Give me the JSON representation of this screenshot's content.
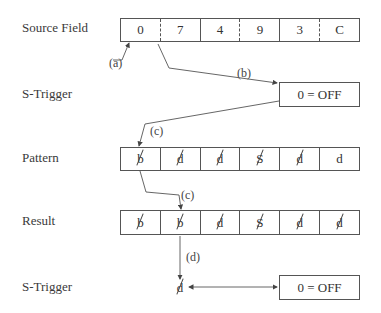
{
  "labels": {
    "source_field": "Source Field",
    "s_trigger_1": "S-Trigger",
    "pattern": "Pattern",
    "result": "Result",
    "s_trigger_2": "S-Trigger"
  },
  "source_field": {
    "cells": [
      {
        "value": "0",
        "divider": "none"
      },
      {
        "value": "7",
        "divider": "dashed"
      },
      {
        "value": "4",
        "divider": "solid"
      },
      {
        "value": "9",
        "divider": "dashed"
      },
      {
        "value": "3",
        "divider": "solid"
      },
      {
        "value": "C",
        "divider": "dashed"
      }
    ]
  },
  "s_trigger_box_1": {
    "text": "0 = OFF"
  },
  "pattern": {
    "cells": [
      {
        "char": "b",
        "slashed": true
      },
      {
        "char": "d",
        "slashed": true
      },
      {
        "char": "d",
        "slashed": true
      },
      {
        "char": "S",
        "slashed": true
      },
      {
        "char": "d",
        "slashed": true
      },
      {
        "char": "d",
        "slashed": false
      }
    ]
  },
  "result": {
    "cells": [
      {
        "char": "b",
        "slashed": true
      },
      {
        "char": "b",
        "slashed": true
      },
      {
        "char": "d",
        "slashed": true
      },
      {
        "char": "S",
        "slashed": true
      },
      {
        "char": "d",
        "slashed": true
      },
      {
        "char": "d",
        "slashed": true
      }
    ]
  },
  "s_trigger_2": {
    "char": "d",
    "slashed": true,
    "box_text": "0 = OFF"
  },
  "callouts": {
    "a": "(a)",
    "b": "(b)",
    "c1": "(c)",
    "c2": "(c)",
    "d": "(d)"
  }
}
